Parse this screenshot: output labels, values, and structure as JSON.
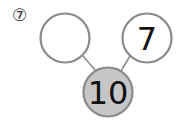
{
  "problem": {
    "label": "⑦"
  },
  "bond": {
    "whole": {
      "value": "10",
      "fill": "#c6c6c6",
      "stroke": "#8a8a8a"
    },
    "parts": [
      {
        "value": "",
        "fill": "#ffffff",
        "stroke": "#8a8a8a"
      },
      {
        "value": "7",
        "fill": "#ffffff",
        "stroke": "#8a8a8a"
      }
    ]
  }
}
